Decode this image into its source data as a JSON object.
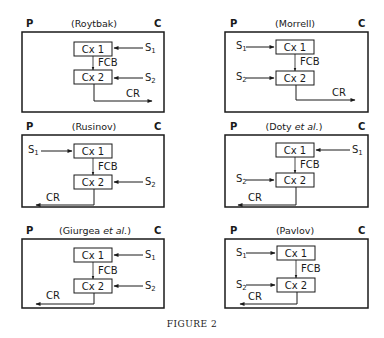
{
  "figure": {
    "caption": "FIGURE 2",
    "left_label": "P",
    "right_label": "C",
    "node_labels": {
      "cx1": "Cx 1",
      "cx2": "Cx 2",
      "fcb": "FCB",
      "cr": "CR",
      "s1": "S",
      "s1_sub": "1",
      "s2": "S",
      "s2_sub": "2"
    },
    "panels": [
      {
        "id": "roytbak",
        "title": "(Roytbak)",
        "s1_side": "right",
        "s2_side": "right",
        "cr_direction": "right"
      },
      {
        "id": "morrell",
        "title": "(Morrell)",
        "s1_side": "left",
        "s2_side": "left",
        "cr_direction": "right"
      },
      {
        "id": "rusinov",
        "title": "(Rusinov)",
        "s1_side": "left",
        "s2_side": "right",
        "cr_direction": "left"
      },
      {
        "id": "doty",
        "title": "(Doty et al.)",
        "title_main": "(Doty ",
        "title_italic": "et al.",
        "title_end": ")",
        "s1_side": "right",
        "s2_side": "left",
        "cr_direction": "left"
      },
      {
        "id": "giurgea",
        "title": "(Giurgea et al.)",
        "title_main": "(Giurgea ",
        "title_italic": "et al.",
        "title_end": ")",
        "s1_side": "right",
        "s2_side": "right",
        "cr_direction": "left"
      },
      {
        "id": "pavlov",
        "title": "(Pavlov)",
        "s1_side": "left",
        "s2_side": "left",
        "cr_direction": "left"
      }
    ]
  },
  "colors": {
    "ink": "#1a1a1a",
    "background": "#ffffff"
  }
}
